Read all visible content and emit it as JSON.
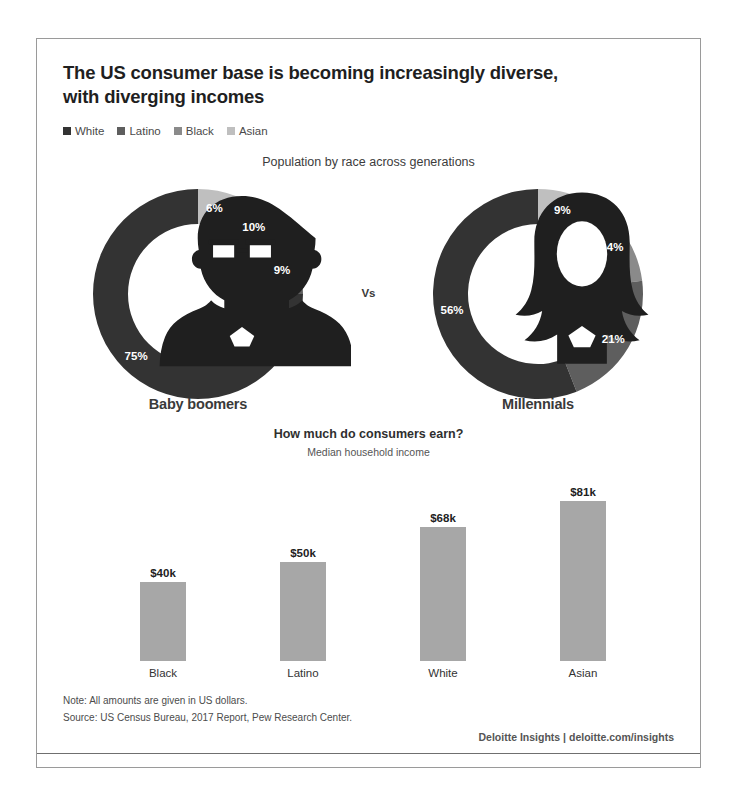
{
  "header": {
    "title_line1": "The US consumer base is becoming increasingly diverse,",
    "title_line2": "with diverging incomes"
  },
  "legend": {
    "items": [
      {
        "label": "White",
        "color": "#333333"
      },
      {
        "label": "Latino",
        "color": "#5e5e5e"
      },
      {
        "label": "Black",
        "color": "#8a8a8a"
      },
      {
        "label": "Asian",
        "color": "#bfbfbf"
      }
    ]
  },
  "separator": {
    "label": "Vs"
  },
  "chart_data": [
    {
      "type": "pie",
      "title": "Population by race across generations",
      "name": "Baby boomers",
      "icon": "bearded-man-icon",
      "categories": [
        "Asian",
        "Black",
        "Latino",
        "White"
      ],
      "values": [
        6,
        10,
        9,
        75
      ],
      "labels": [
        "6%",
        "10%",
        "9%",
        "75%"
      ],
      "colors": [
        "#bfbfbf",
        "#8a8a8a",
        "#5e5e5e",
        "#333333"
      ],
      "legend_position": "top",
      "units": "percent"
    },
    {
      "type": "pie",
      "title": "Population by race across generations",
      "name": "Millennials",
      "icon": "long-haired-woman-icon",
      "categories": [
        "Asian",
        "Black",
        "Latino",
        "White"
      ],
      "values": [
        9,
        14,
        21,
        56
      ],
      "labels": [
        "9%",
        "14%",
        "21%",
        "56%"
      ],
      "colors": [
        "#bfbfbf",
        "#8a8a8a",
        "#5e5e5e",
        "#333333"
      ],
      "legend_position": "top",
      "units": "percent"
    },
    {
      "type": "bar",
      "title": "How much do consumers earn?",
      "subtitle": "Median household income",
      "categories": [
        "Black",
        "Latino",
        "White",
        "Asian"
      ],
      "values": [
        40,
        50,
        68,
        81
      ],
      "labels": [
        "$40k",
        "$50k",
        "$68k",
        "$81k"
      ],
      "xlabel": "",
      "ylabel": "Median household income",
      "ylim": [
        0,
        90
      ],
      "grid": false,
      "bar_color": "#a7a7a7",
      "units": "thousands of US dollars"
    }
  ],
  "footer": {
    "note": "Note: All amounts are given in US dollars.",
    "source": "Source: US Census Bureau, 2017 Report, Pew Research Center.",
    "attribution": "Deloitte Insights | deloitte.com/insights"
  }
}
